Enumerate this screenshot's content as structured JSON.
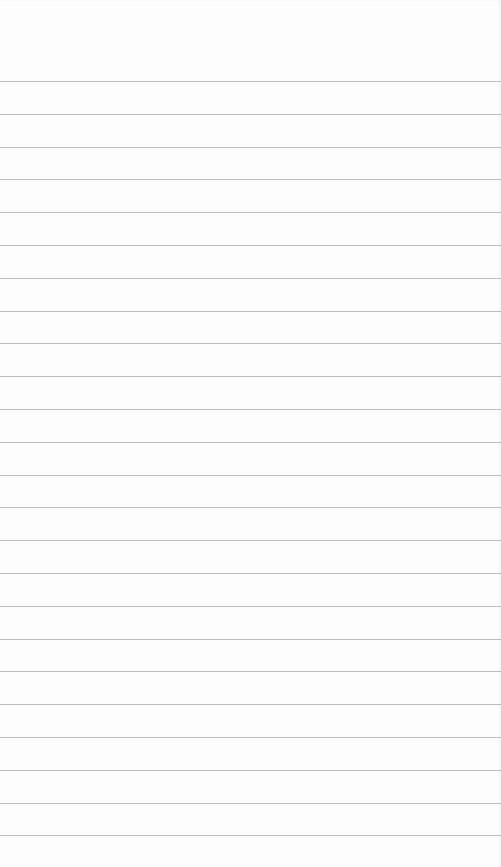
{
  "page": {
    "type": "ruled-notes-page",
    "background_color": "#fdfdfd",
    "line_color": "#bdbdbd",
    "first_line_y": 81,
    "line_spacing": 32.8,
    "line_count": 24,
    "lines": [
      "",
      "",
      "",
      "",
      "",
      "",
      "",
      "",
      "",
      "",
      "",
      "",
      "",
      "",
      "",
      "",
      "",
      "",
      "",
      "",
      "",
      "",
      "",
      ""
    ]
  }
}
